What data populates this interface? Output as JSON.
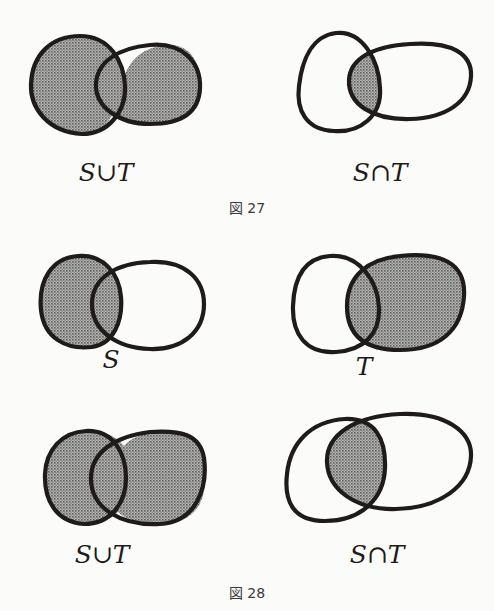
{
  "figures": [
    {
      "caption": "図 27",
      "diagrams": [
        {
          "label": "S∪T",
          "shaded_region": "union"
        },
        {
          "label": "S∩T",
          "shaded_region": "intersection"
        }
      ]
    },
    {
      "caption": "図 28",
      "diagrams": [
        {
          "label": "S",
          "shaded_region": "S"
        },
        {
          "label": "T",
          "shaded_region": "T"
        },
        {
          "label": "S∪T",
          "shaded_region": "union"
        },
        {
          "label": "S∩T",
          "shaded_region": "intersection"
        }
      ]
    }
  ],
  "colors": {
    "background": "#fbfbf9",
    "outline": "#1e1b19",
    "shading": "#8f8f8f"
  }
}
